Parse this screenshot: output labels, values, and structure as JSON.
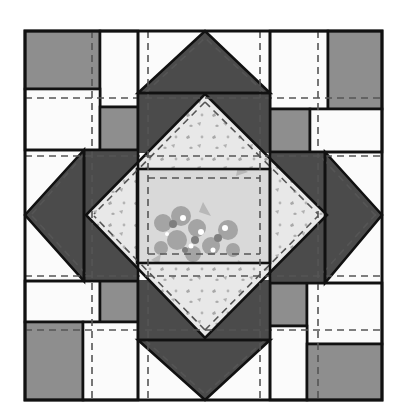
{
  "diagram": {
    "type": "quilt-block",
    "colors": {
      "background": "#ffffff",
      "outline": "#111111",
      "dark": "#4b4b4b",
      "medium": "#8e8e8e",
      "light": "#fbfbfb",
      "floral_light": "#e6e6e6",
      "floral_center": "#d4d4d4",
      "floral_motif": "#9a9a9a",
      "floral_highlight": "#ffffff",
      "seam": "#555555"
    },
    "bounds": {
      "x1": 25,
      "y1": 31,
      "x2": 382,
      "y2": 400
    },
    "corner_units": [
      {
        "name": "top-left",
        "pieces": [
          {
            "x": 25,
            "y": 31,
            "w": 75,
            "h": 58,
            "fill": "medium"
          },
          {
            "x": 100,
            "y": 31,
            "w": 38,
            "h": 76,
            "fill": "light"
          },
          {
            "x": 25,
            "y": 89,
            "w": 75,
            "h": 61,
            "fill": "light"
          },
          {
            "x": 100,
            "y": 107,
            "w": 38,
            "h": 43,
            "fill": "medium"
          }
        ]
      },
      {
        "name": "top-right",
        "pieces": [
          {
            "x": 270,
            "y": 31,
            "w": 58,
            "h": 78,
            "fill": "light"
          },
          {
            "x": 328,
            "y": 31,
            "w": 54,
            "h": 78,
            "fill": "medium"
          },
          {
            "x": 270,
            "y": 109,
            "w": 40,
            "h": 43,
            "fill": "medium"
          },
          {
            "x": 310,
            "y": 109,
            "w": 72,
            "h": 43,
            "fill": "light"
          }
        ]
      },
      {
        "name": "bottom-left",
        "pieces": [
          {
            "x": 25,
            "y": 281,
            "w": 75,
            "h": 41,
            "fill": "light"
          },
          {
            "x": 100,
            "y": 281,
            "w": 38,
            "h": 41,
            "fill": "medium"
          },
          {
            "x": 25,
            "y": 322,
            "w": 58,
            "h": 78,
            "fill": "medium"
          },
          {
            "x": 83,
            "y": 322,
            "w": 55,
            "h": 78,
            "fill": "light"
          }
        ]
      },
      {
        "name": "bottom-right",
        "pieces": [
          {
            "x": 270,
            "y": 283,
            "w": 37,
            "h": 43,
            "fill": "medium"
          },
          {
            "x": 307,
            "y": 283,
            "w": 75,
            "h": 61,
            "fill": "light"
          },
          {
            "x": 270,
            "y": 326,
            "w": 37,
            "h": 74,
            "fill": "light"
          },
          {
            "x": 307,
            "y": 344,
            "w": 75,
            "h": 56,
            "fill": "medium"
          }
        ]
      }
    ],
    "flying_geese": [
      {
        "name": "top-outer",
        "points": "138,93 205,31 270,93",
        "fill": "dark"
      },
      {
        "name": "bottom-outer",
        "points": "138,340 205,400 270,340",
        "fill": "dark"
      },
      {
        "name": "left-outer",
        "points": "84,150 25,215 84,281",
        "fill": "dark"
      },
      {
        "name": "right-outer",
        "points": "325,152 382,215 325,283",
        "fill": "dark"
      }
    ],
    "center": {
      "diamond_points": "205,94 327,215 205,338 86,215",
      "rectangle": {
        "x": 137,
        "y": 169,
        "w": 133,
        "h": 94
      }
    },
    "labels": []
  }
}
